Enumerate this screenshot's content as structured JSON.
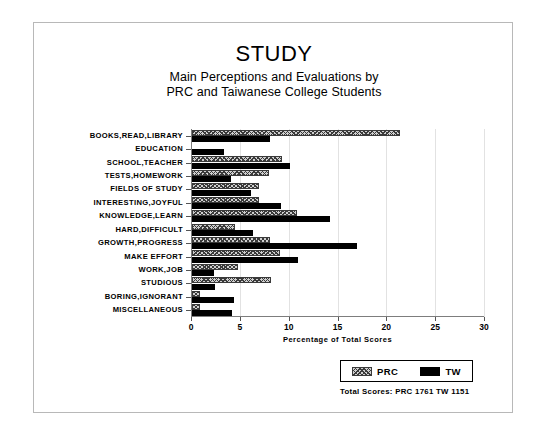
{
  "chart_data": {
    "type": "bar",
    "orientation": "horizontal",
    "title": "STUDY",
    "subtitle_line1": "Main Perceptions and Evaluations by",
    "subtitle_line2": "PRC and Taiwanese College Students",
    "xlabel": "Percentage of Total Scores",
    "ylabel": "",
    "xlim": [
      0,
      30
    ],
    "xticks": [
      0,
      5,
      10,
      15,
      20,
      25,
      30
    ],
    "grid": true,
    "legend_position": "bottom-right",
    "categories": [
      "BOOKS,READ,LIBRARY",
      "EDUCATION",
      "SCHOOL,TEACHER",
      "TESTS,HOMEWORK",
      "FIELDS OF STUDY",
      "INTERESTING,JOYFUL",
      "KNOWLEDGE,LEARN",
      "HARD,DIFFICULT",
      "GROWTH,PROGRESS",
      "MAKE EFFORT",
      "WORK,JOB",
      "STUDIOUS",
      "BORING,IGNORANT",
      "MISCELLANEOUS"
    ],
    "series": [
      {
        "name": "PRC",
        "values": [
          21.3,
          0.0,
          9.2,
          7.9,
          6.9,
          6.9,
          10.7,
          4.4,
          8.0,
          9.0,
          4.7,
          8.1,
          0.8,
          0.8
        ]
      },
      {
        "name": "TW",
        "values": [
          8.0,
          3.3,
          10.0,
          4.0,
          6.0,
          9.1,
          14.1,
          6.2,
          16.9,
          10.9,
          2.3,
          2.4,
          4.3,
          4.1
        ]
      }
    ],
    "annotations": {
      "totals": "Total Scores:  PRC 1761  TW 1151"
    },
    "colors": {
      "prc_fill": "#cfcfcf",
      "prc_hatch": "#3a3a3a",
      "tw_fill": "#000000",
      "grid": "#e2e2e2",
      "axis": "#7d7d7d",
      "frame": "#b8b8b8",
      "background": "#ffffff"
    }
  },
  "legend": {
    "items": [
      {
        "label": "PRC",
        "swatch": "hatched-swatch"
      },
      {
        "label": "TW",
        "swatch": "solid-black-swatch"
      }
    ]
  }
}
